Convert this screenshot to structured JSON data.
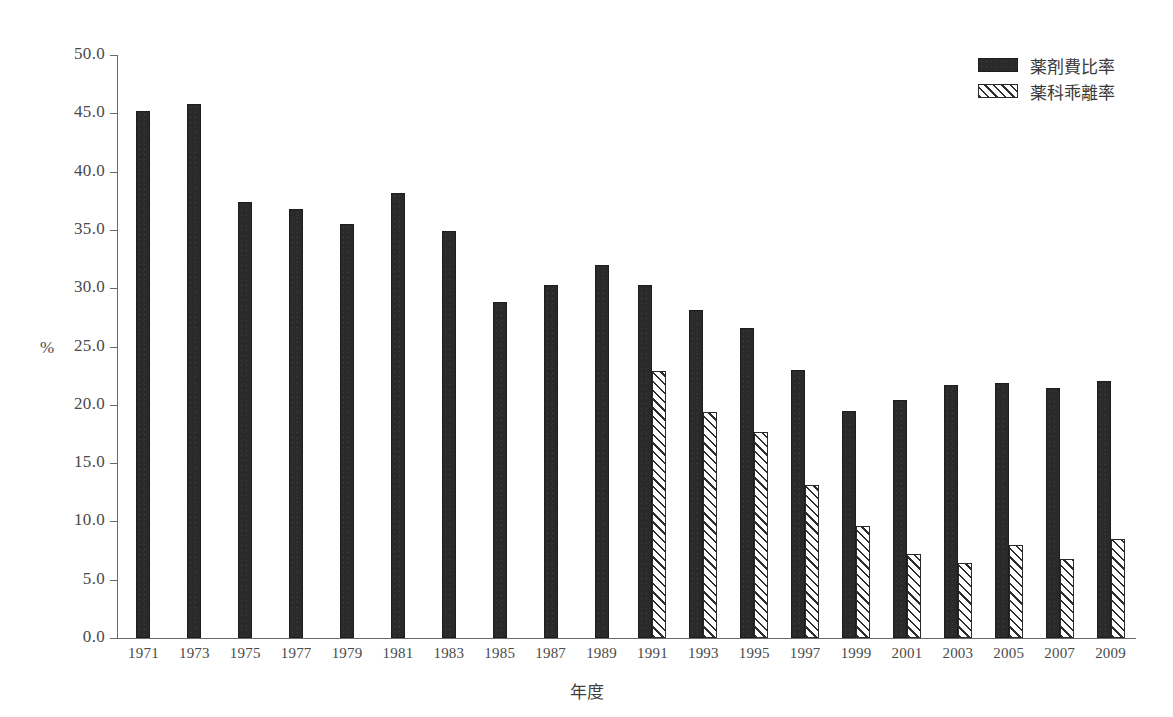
{
  "chart_data": {
    "type": "bar",
    "title": "",
    "xlabel": "年度",
    "ylabel": "%",
    "ylim": [
      0.0,
      50.0
    ],
    "ytick_step": 5.0,
    "ytick_labels": [
      "0.0",
      "5.0",
      "10.0",
      "15.0",
      "20.0",
      "25.0",
      "30.0",
      "35.0",
      "40.0",
      "45.0",
      "50.0"
    ],
    "grid": false,
    "legend_position": "top-right",
    "categories": [
      "1971",
      "1973",
      "1975",
      "1977",
      "1979",
      "1981",
      "1983",
      "1985",
      "1987",
      "1989",
      "1991",
      "1993",
      "1995",
      "1997",
      "1999",
      "2001",
      "2003",
      "2005",
      "2007",
      "2009"
    ],
    "series": [
      {
        "name": "薬剤費比率",
        "fill": "solid",
        "color": "#2a2a2a",
        "values": [
          45.2,
          45.8,
          37.4,
          36.8,
          35.5,
          38.2,
          34.9,
          28.8,
          30.3,
          32.0,
          30.3,
          28.1,
          26.6,
          23.0,
          19.5,
          20.4,
          21.7,
          21.9,
          21.4,
          22.0
        ]
      },
      {
        "name": "薬科乖離率",
        "fill": "hatched",
        "color": "#2d2d2d",
        "values": [
          null,
          null,
          null,
          null,
          null,
          null,
          null,
          null,
          null,
          null,
          22.9,
          19.4,
          17.7,
          13.1,
          9.6,
          7.2,
          6.4,
          8.0,
          6.8,
          8.5
        ]
      }
    ]
  },
  "legend": {
    "items": [
      {
        "label": "薬剤費比率",
        "fill": "solid"
      },
      {
        "label": "薬科乖離率",
        "fill": "hatched"
      }
    ]
  },
  "axes": {
    "y_title": "%",
    "x_title": "年度"
  }
}
